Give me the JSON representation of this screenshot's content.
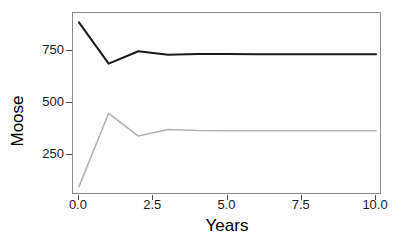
{
  "chart_data": {
    "type": "line",
    "title": "",
    "subtitle": "",
    "xlabel": "Years",
    "ylabel": "Moose",
    "xlim": [
      -0.2,
      10.2
    ],
    "ylim": [
      55,
      935
    ],
    "xticks": [
      0.0,
      2.5,
      5.0,
      7.5,
      10.0
    ],
    "xtick_labels": [
      "0.0",
      "2.5",
      "5.0",
      "7.5",
      "10.0"
    ],
    "yticks": [
      250,
      500,
      750
    ],
    "ytick_labels": [
      "250",
      "500",
      "750"
    ],
    "grid": false,
    "legend": "none",
    "x": [
      0,
      1,
      2,
      3,
      4,
      5,
      6,
      7,
      8,
      9,
      10
    ],
    "series": [
      {
        "name": "upper-trajectory",
        "color": "#1a1a1a",
        "linewidth": 2.0,
        "values": [
          890,
          690,
          750,
          733,
          737,
          737,
          736,
          736,
          735,
          735,
          735
        ]
      },
      {
        "name": "lower-trajectory",
        "color": "#b3b3b3",
        "linewidth": 1.6,
        "values": [
          95,
          450,
          340,
          372,
          367,
          366,
          366,
          366,
          366,
          366,
          366
        ]
      }
    ],
    "panel": {
      "background": "#ffffff",
      "border_color": "#8c8c8c",
      "tick_color": "#4d4d4d"
    }
  }
}
